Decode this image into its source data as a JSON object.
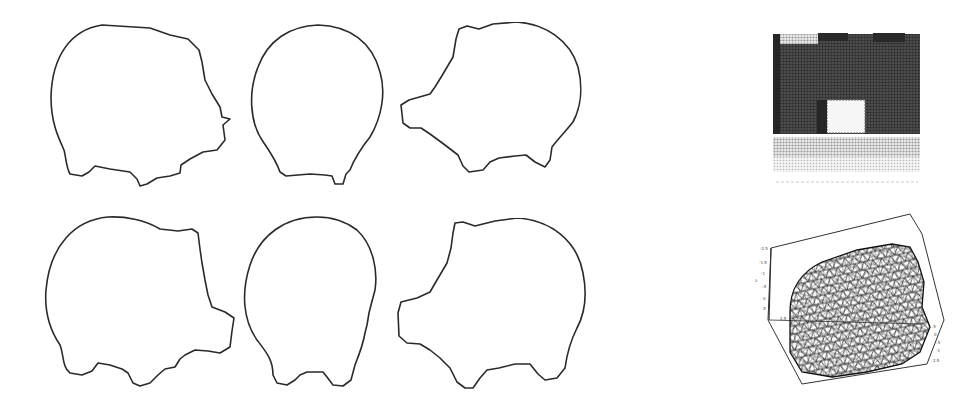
{
  "figure": {
    "silhouettes": {
      "rows": 2,
      "columns": 3,
      "items": [
        {
          "row": 1,
          "col": 1,
          "view": "side-facing-right"
        },
        {
          "row": 1,
          "col": 2,
          "view": "front"
        },
        {
          "row": 1,
          "col": 3,
          "view": "side-facing-left"
        },
        {
          "row": 2,
          "col": 1,
          "view": "side-facing-right"
        },
        {
          "row": 2,
          "col": 2,
          "view": "front"
        },
        {
          "row": 2,
          "col": 3,
          "view": "side-facing-left"
        }
      ],
      "stroke_color": "#2a2a2a"
    },
    "photo": {
      "description": "halftone grayscale photo of dark rectangular object with white square patch",
      "dark_color": "#3a3a3a",
      "light_color": "#e8e8e8"
    },
    "mesh_plot": {
      "type": "3d-triangulated-surface",
      "tick_labels_left": [
        "-2.5",
        "-1.5",
        "-1",
        "-.5",
        "0",
        ".5",
        "2.5"
      ],
      "tick_labels_right": [
        ".5",
        "0",
        "-.5",
        "-1",
        "2.5"
      ],
      "axis_label": "z"
    }
  }
}
